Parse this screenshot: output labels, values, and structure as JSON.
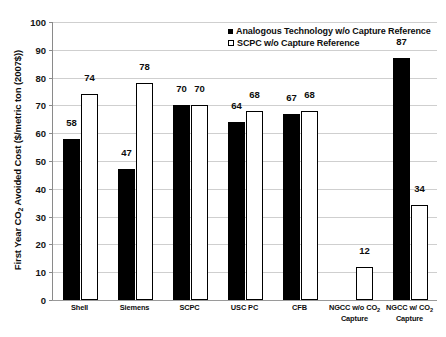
{
  "chart_data": {
    "type": "bar",
    "title": "",
    "xlabel": "",
    "ylabel": "First Year CO2 Avoided Cost ($/metric ton (2007$))",
    "ylim": [
      0,
      100
    ],
    "ytick_step": 10,
    "yticks": [
      100,
      90,
      80,
      70,
      60,
      50,
      40,
      30,
      20,
      10,
      0
    ],
    "grid": true,
    "legend_position": "top-right",
    "categories": [
      "Shell",
      "Siemens",
      "SCPC",
      "USC PC",
      "CFB",
      "NGCC w/o CO2 Capture",
      "NGCC w/ CO2 Capture"
    ],
    "category_labels": [
      {
        "line1": "Shell",
        "line2": ""
      },
      {
        "line1": "Siemens",
        "line2": ""
      },
      {
        "line1": "SCPC",
        "line2": ""
      },
      {
        "line1": "USC PC",
        "line2": ""
      },
      {
        "line1": "CFB",
        "line2": ""
      },
      {
        "line1_pre": "NGCC w/o CO",
        "line1_sub": "2",
        "line2": "Capture"
      },
      {
        "line1_pre": "NGCC w/ CO",
        "line1_sub": "2",
        "line2": "Capture"
      }
    ],
    "series": [
      {
        "name": "Analogous Technology w/o Capture  Reference",
        "style": "solid-black",
        "color": "#000000",
        "values": [
          58,
          47,
          70,
          64,
          67,
          null,
          87
        ],
        "labels": [
          "58",
          "47",
          "70",
          "64",
          "67",
          "",
          "87"
        ]
      },
      {
        "name": "SCPC w/o Capture Reference",
        "style": "hollow-white",
        "color": "#ffffff",
        "values": [
          74,
          78,
          70,
          68,
          68,
          12,
          34
        ],
        "labels": [
          "74",
          "78",
          "70",
          "68",
          "68",
          "12",
          "34"
        ]
      }
    ]
  },
  "axis": {
    "y_title_pre": "First Year CO",
    "y_title_sub": "2",
    "y_title_post": " Avoided Cost ($/metric ton (2007$))"
  },
  "legend": {
    "items": [
      {
        "label": "Analogous Technology w/o Capture  Reference",
        "swatch": "solid"
      },
      {
        "label": "SCPC w/o Capture Reference",
        "swatch": "hollow"
      }
    ]
  }
}
